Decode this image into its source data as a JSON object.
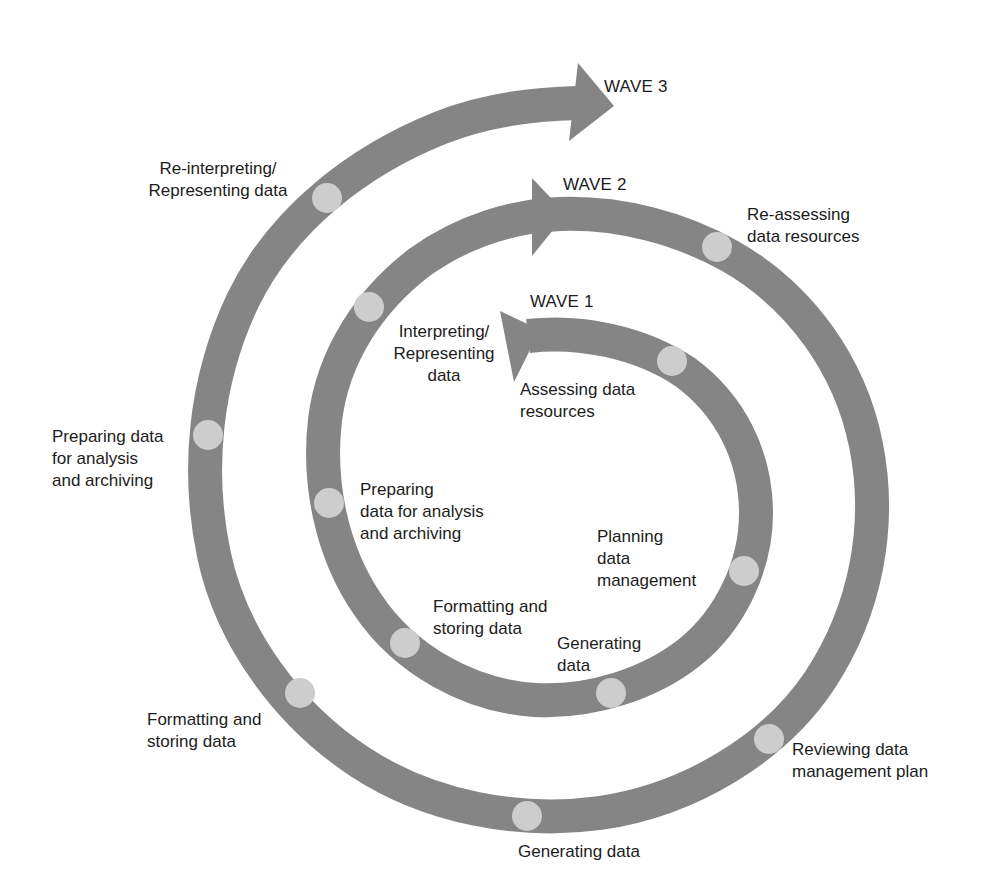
{
  "diagram": {
    "colors": {
      "band": "#858585",
      "dot": "#cdcdcd",
      "text": "#1c1c1c",
      "background": "#ffffff"
    },
    "waves": [
      {
        "id": "wave1",
        "title": "WAVE 1",
        "stages": [
          "Assessing data\nresources",
          "Planning\ndata\nmanagement",
          "Generating\ndata",
          "Formatting and\nstoring data",
          "Preparing\ndata for analysis\nand archiving",
          "Interpreting/\nRepresenting\ndata"
        ]
      },
      {
        "id": "wave2",
        "title": "WAVE 2",
        "stages": [
          "Re-assessing\ndata resources",
          "Reviewing data\nmanagement plan",
          "Generating data",
          "Formatting and\nstoring data",
          "Preparing data\nfor analysis\nand archiving",
          "Re-interpreting/\nRepresenting data"
        ]
      },
      {
        "id": "wave3",
        "title": "WAVE 3",
        "stages": []
      }
    ]
  }
}
